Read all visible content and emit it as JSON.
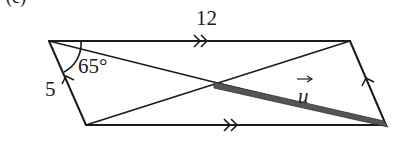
{
  "figure": {
    "part_label": "(c)",
    "shape": "parallelogram",
    "vertices": {
      "top_left": [
        49,
        41
      ],
      "top_right": [
        350,
        41
      ],
      "bottom_right": [
        386,
        125
      ],
      "bottom_left": [
        86,
        125
      ]
    },
    "diagonal_intersection": [
      216,
      84
    ],
    "labels": {
      "top_side": "12",
      "left_side": "5",
      "angle": "65°",
      "vector": "u"
    },
    "markings": {
      "top_side": "double-arrow",
      "bottom_side": "double-arrow",
      "left_side": "single-arrow",
      "right_side": "single-arrow"
    },
    "vector_u": {
      "from": "diagonal_intersection",
      "to": "bottom_right",
      "style": "thick-gray-segment"
    },
    "colors": {
      "line": "#1a1a1a",
      "vector": "#555555",
      "background": "#ffffff"
    }
  }
}
